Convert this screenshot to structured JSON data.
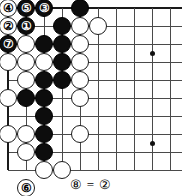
{
  "figure": {
    "type": "go-board-diagram",
    "caption": "⑧ = ②",
    "board": {
      "grid_origin_x": 8,
      "grid_origin_y": 8,
      "grid_spacing": 18,
      "cols": 10,
      "rows": 10,
      "edges": {
        "top": true,
        "left": true,
        "bottom": true,
        "right": false
      },
      "star_points": [
        {
          "x": 152,
          "y": 53
        },
        {
          "x": 152,
          "y": 143
        }
      ]
    }
  },
  "chart_data": {
    "type": "table",
    "caption": "⑧ = ②",
    "grid": {
      "spacing": 18,
      "origin_x": 8,
      "origin_y": 8
    },
    "star_points": [
      [
        152,
        53
      ],
      [
        152,
        143
      ]
    ],
    "stones": [
      {
        "color": "white",
        "label": "④",
        "x": 8,
        "y": 8
      },
      {
        "color": "black",
        "label": "⑤",
        "x": 26,
        "y": 8
      },
      {
        "color": "black",
        "label": "③",
        "x": 44,
        "y": 8
      },
      {
        "color": "black",
        "label": "",
        "x": 80,
        "y": 8
      },
      {
        "color": "white",
        "label": "②",
        "x": 8,
        "y": 26
      },
      {
        "color": "black",
        "label": "①",
        "x": 26,
        "y": 26
      },
      {
        "color": "black",
        "label": "",
        "x": 62,
        "y": 26
      },
      {
        "color": "white",
        "label": "",
        "x": 80,
        "y": 26
      },
      {
        "color": "white",
        "label": "",
        "x": 98,
        "y": 26
      },
      {
        "color": "black",
        "label": "⑦",
        "x": 8,
        "y": 44
      },
      {
        "color": "white",
        "label": "",
        "x": 26,
        "y": 44
      },
      {
        "color": "black",
        "label": "",
        "x": 44,
        "y": 44
      },
      {
        "color": "black",
        "label": "",
        "x": 62,
        "y": 44
      },
      {
        "color": "white",
        "label": "",
        "x": 80,
        "y": 44
      },
      {
        "color": "white",
        "label": "",
        "x": 8,
        "y": 62
      },
      {
        "color": "white",
        "label": "",
        "x": 26,
        "y": 62
      },
      {
        "color": "white",
        "label": "",
        "x": 44,
        "y": 62
      },
      {
        "color": "black",
        "label": "",
        "x": 62,
        "y": 62
      },
      {
        "color": "white",
        "label": "",
        "x": 80,
        "y": 62
      },
      {
        "color": "white",
        "label": "",
        "x": 26,
        "y": 80
      },
      {
        "color": "black",
        "label": "",
        "x": 44,
        "y": 80
      },
      {
        "color": "black",
        "label": "",
        "x": 62,
        "y": 80
      },
      {
        "color": "white",
        "label": "",
        "x": 80,
        "y": 80
      },
      {
        "color": "white",
        "label": "",
        "x": 8,
        "y": 98
      },
      {
        "color": "black",
        "label": "",
        "x": 26,
        "y": 98
      },
      {
        "color": "black",
        "label": "",
        "x": 44,
        "y": 98
      },
      {
        "color": "white",
        "label": "",
        "x": 80,
        "y": 98
      },
      {
        "color": "black",
        "label": "",
        "x": 44,
        "y": 116
      },
      {
        "color": "white",
        "label": "",
        "x": 8,
        "y": 134
      },
      {
        "color": "white",
        "label": "",
        "x": 26,
        "y": 134
      },
      {
        "color": "black",
        "label": "",
        "x": 44,
        "y": 134
      },
      {
        "color": "white",
        "label": "",
        "x": 80,
        "y": 134
      },
      {
        "color": "white",
        "label": "",
        "x": 26,
        "y": 152
      },
      {
        "color": "black",
        "label": "",
        "x": 44,
        "y": 152
      },
      {
        "color": "white",
        "label": "",
        "x": 44,
        "y": 170
      },
      {
        "color": "white",
        "label": "",
        "x": 62,
        "y": 170
      },
      {
        "color": "white",
        "label": "⑥",
        "x": 26,
        "y": 188
      }
    ],
    "move_numbers": {
      "1": "①",
      "2": "②",
      "3": "③",
      "4": "④",
      "5": "⑤",
      "6": "⑥",
      "7": "⑦",
      "8": "⑧"
    },
    "xlabel": "",
    "ylabel": "",
    "grid_on": true,
    "legend": "none"
  }
}
